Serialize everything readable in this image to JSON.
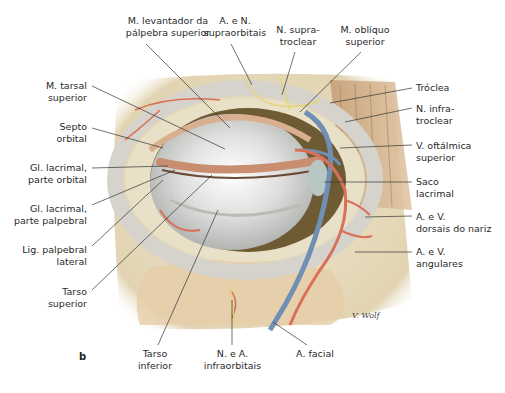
{
  "figure": {
    "panel_letter": "b",
    "signature": "V. Wolf",
    "labels": {
      "top": [
        {
          "id": "levantador",
          "line1": "M. levantador da",
          "line2": "pálpebra superior"
        },
        {
          "id": "supraorbitais",
          "line1": "A. e N.",
          "line2": "supraorbitais"
        },
        {
          "id": "supratroclear",
          "line1": "N. supra-",
          "line2": "troclear"
        },
        {
          "id": "obliquo",
          "line1": "M. oblíquo",
          "line2": "superior"
        }
      ],
      "left": [
        {
          "id": "tarsal",
          "line1": "M. tarsal",
          "line2": "superior"
        },
        {
          "id": "septo",
          "line1": "Septo",
          "line2": "orbital"
        },
        {
          "id": "gl_orbital",
          "line1": "Gl. lacrimal,",
          "line2": "parte orbital"
        },
        {
          "id": "gl_palpebral",
          "line1": "Gl. lacrimal,",
          "line2": "parte palpebral"
        },
        {
          "id": "lig",
          "line1": "Lig. palpebral",
          "line2": "lateral"
        },
        {
          "id": "tarso_sup",
          "line1": "Tarso",
          "line2": "superior"
        }
      ],
      "right": [
        {
          "id": "troclea",
          "line1": "Tróclea",
          "line2": ""
        },
        {
          "id": "infratroclear",
          "line1": "N. infra-",
          "line2": "troclear"
        },
        {
          "id": "oftalmica",
          "line1": "V. oftálmica",
          "line2": "superior"
        },
        {
          "id": "saco",
          "line1": "Saco",
          "line2": "lacrimal"
        },
        {
          "id": "dorsais",
          "line1": "A. e V.",
          "line2": "dorsais do nariz"
        },
        {
          "id": "angulares",
          "line1": "A. e V.",
          "line2": "angulares"
        }
      ],
      "bottom": [
        {
          "id": "tarso_inf",
          "line1": "Tarso",
          "line2": "inferior"
        },
        {
          "id": "infraorbitais",
          "line1": "N. e A.",
          "line2": "infraorbitais"
        },
        {
          "id": "facial",
          "line1": "A. facial",
          "line2": ""
        }
      ]
    },
    "colors": {
      "skin": "#e9dfc4",
      "bone": "#efe8d6",
      "sclera": "#e6e6e4",
      "artery": "#d9705a",
      "vein": "#6f8fb5",
      "nerve": "#e3d57a",
      "muscle": "#c9a680",
      "leader": "#333333"
    }
  }
}
